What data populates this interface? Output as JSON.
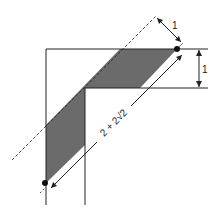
{
  "diagram": {
    "labels": {
      "perpendicular_width": "1",
      "corridor_width": "1",
      "diagonal_length": "2 + 2√2"
    },
    "colors": {
      "stroke": "#222222",
      "shade": "#6b6b6b",
      "background": "#ffffff"
    }
  }
}
